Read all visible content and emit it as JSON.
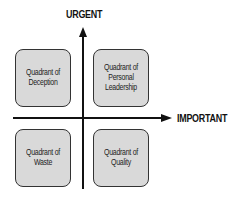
{
  "axes": {
    "vertical_label": "URGENT",
    "horizontal_label": "IMPORTANT"
  },
  "quadrants": [
    {
      "position": "top-left",
      "label": "Quadrant of Deception"
    },
    {
      "position": "top-right",
      "label": "Quadrant of Personal Leadership"
    },
    {
      "position": "bottom-left",
      "label": "Quadrant of Waste"
    },
    {
      "position": "bottom-right",
      "label": "Quadrant of Quality"
    }
  ],
  "colors": {
    "box_fill": "#d9d9d9",
    "axis": "#111111"
  }
}
